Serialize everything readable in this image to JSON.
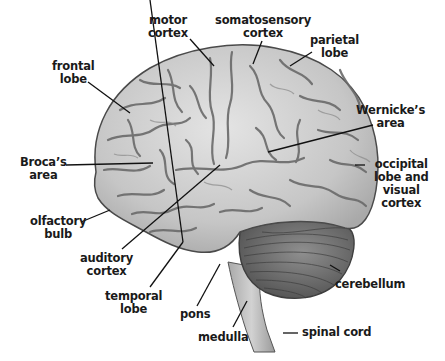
{
  "diagram": {
    "colors": {
      "cortex_fill": "#c4c4c4",
      "cortex_light": "#e2e2e2",
      "sulci": "#6a6a6a",
      "outline": "#4a4a4a",
      "cerebellum": "#7d7d7d",
      "cerebellum_dark": "#555555",
      "brainstem": "#bdbdbd",
      "leader_line": "#111111",
      "label_text": "#1a1a1a",
      "background": "#ffffff"
    },
    "labels": [
      {
        "id": "motor-cortex",
        "lines": [
          "motor",
          "cortex"
        ]
      },
      {
        "id": "somatosensory-cortex",
        "lines": [
          "somatosensory",
          "cortex"
        ]
      },
      {
        "id": "parietal-lobe",
        "lines": [
          "parietal",
          "lobe"
        ]
      },
      {
        "id": "frontal-lobe",
        "lines": [
          "frontal",
          "lobe"
        ]
      },
      {
        "id": "wernickes-area",
        "lines": [
          "Wernicke’s",
          "area"
        ]
      },
      {
        "id": "brocas-area",
        "lines": [
          "Broca’s",
          "area"
        ]
      },
      {
        "id": "occipital-lobe",
        "lines": [
          "occipital",
          "lobe and",
          "visual",
          "cortex"
        ]
      },
      {
        "id": "olfactory-bulb",
        "lines": [
          "olfactory",
          "bulb"
        ]
      },
      {
        "id": "auditory-cortex",
        "lines": [
          "auditory",
          "cortex"
        ]
      },
      {
        "id": "cerebellum",
        "lines": [
          "cerebellum"
        ]
      },
      {
        "id": "temporal-lobe",
        "lines": [
          "temporal",
          "lobe"
        ]
      },
      {
        "id": "pons",
        "lines": [
          "pons"
        ]
      },
      {
        "id": "medulla",
        "lines": [
          "medulla"
        ]
      },
      {
        "id": "spinal-cord",
        "lines": [
          "spinal cord"
        ]
      }
    ]
  }
}
